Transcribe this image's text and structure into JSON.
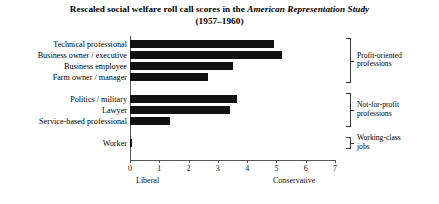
{
  "chart_data": {
    "type": "bar",
    "orientation": "horizontal",
    "title": "Rescaled social welfare roll call scores in the American Representation Study",
    "title_line1_plain": "Rescaled social welfare roll call scores in the ",
    "title_line1_italic": "American Representation Study",
    "title_line2": "(1957–1960)",
    "xlabel": "",
    "ylabel": "",
    "xlim": [
      0,
      7
    ],
    "grid": false,
    "legend": "none",
    "xticks": [
      "0",
      "1",
      "2",
      "3",
      "4",
      "5",
      "6",
      "7"
    ],
    "xtick_values": [
      0,
      1,
      2,
      3,
      4,
      5,
      6,
      7
    ],
    "axis_endpoint_labels": {
      "low": "Liberal",
      "high": "Conservative"
    },
    "categories": [
      "Technical professional",
      "Business owner / executive",
      "Business employee",
      "Farm owner / manager",
      "Politics / military",
      "Lawyer",
      "Service-based professional",
      "Worker"
    ],
    "values": [
      4.9,
      5.2,
      3.5,
      2.65,
      3.65,
      3.4,
      1.35,
      0.05
    ],
    "groups": [
      {
        "label_line1": "Profit-oriented",
        "label_line2": "professions",
        "members": [
          "Technical professional",
          "Business owner / executive",
          "Business employee",
          "Farm owner / manager"
        ]
      },
      {
        "label_line1": "Not-for-profit",
        "label_line2": "professions",
        "members": [
          "Politics / military",
          "Lawyer",
          "Service-based professional"
        ]
      },
      {
        "label_line1": "Working-class",
        "label_line2": "jobs",
        "members": [
          "Worker"
        ]
      }
    ],
    "colors": {
      "bar": "#111111",
      "axis": "#555555",
      "text": "#000000",
      "background": "#ffffff"
    }
  }
}
